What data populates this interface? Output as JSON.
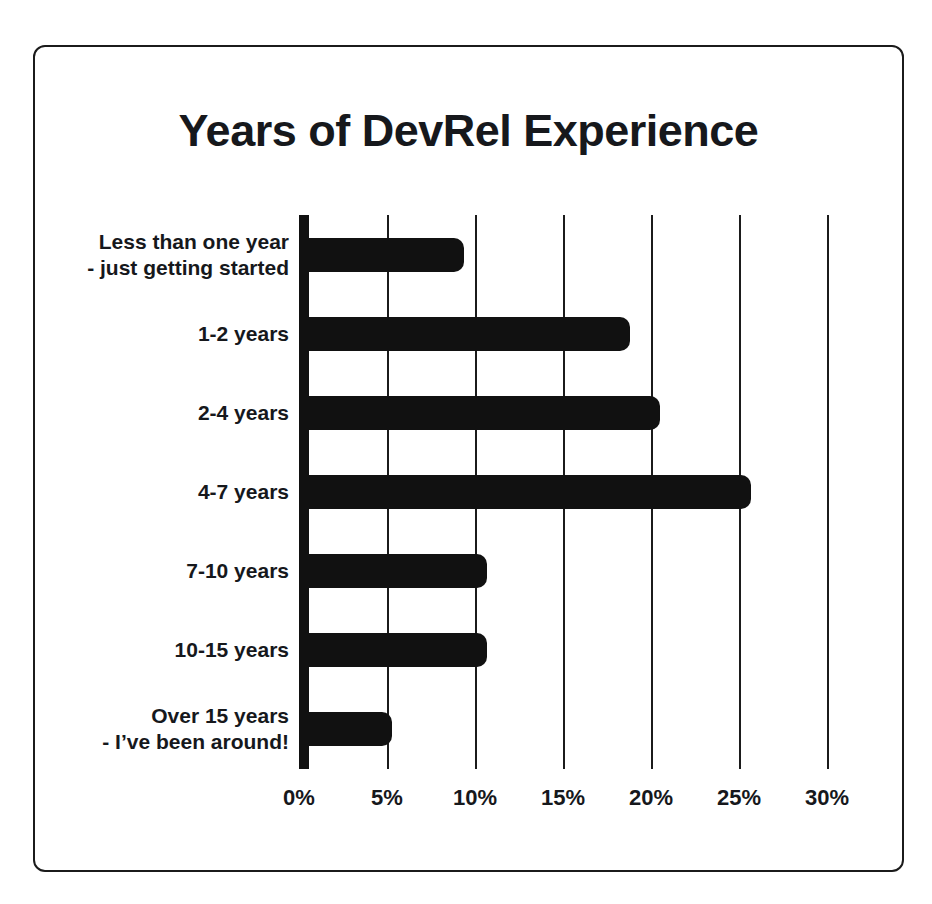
{
  "chart_data": {
    "type": "bar",
    "orientation": "horizontal",
    "title": "Years of DevRel Experience",
    "xlabel": "",
    "ylabel": "",
    "categories": [
      "Less than one year\n- just getting started",
      "1-2 years",
      "2-4 years",
      "4-7 years",
      "7-10 years",
      "10-15 years",
      "Over 15 years\n- I’ve been around!"
    ],
    "values": [
      9.4,
      18.8,
      20.5,
      25.7,
      10.7,
      10.7,
      5.3
    ],
    "value_unit": "%",
    "xlim": [
      0,
      30
    ],
    "xticks": [
      0,
      5,
      10,
      15,
      20,
      25,
      30
    ],
    "xtick_labels": [
      "0%",
      "5%",
      "10%",
      "15%",
      "20%",
      "25%",
      "30%"
    ],
    "grid": "vertical",
    "legend": "none",
    "bar_color": "#111111",
    "axis_color": "#111111",
    "background_color": "#ffffff",
    "border_color": "#1b1b1b"
  }
}
